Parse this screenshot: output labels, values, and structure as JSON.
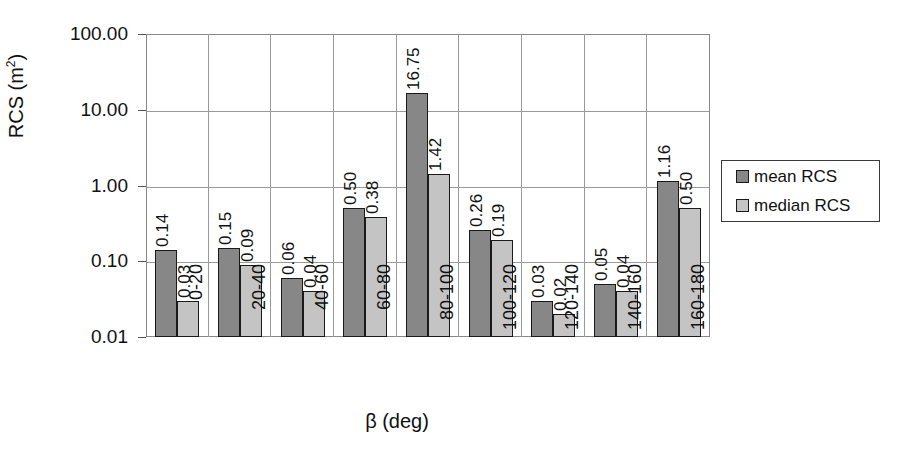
{
  "chart_data": {
    "type": "bar",
    "title": "",
    "xlabel": "β (deg)",
    "ylabel": "RCS (m²)",
    "ylabel_base": "RCS (m",
    "ylabel_sup": "2",
    "ylabel_tail": ")",
    "yscale": "log",
    "ylim": [
      0.01,
      100
    ],
    "grid": true,
    "legend_position": "right",
    "categories": [
      "0-20",
      "20-40",
      "40-60",
      "60-80",
      "80-100",
      "100-120",
      "120-140",
      "140-160",
      "160-180"
    ],
    "ytick_labels": [
      "100.00",
      "10.00",
      "1.00",
      "0.10",
      "0.01"
    ],
    "ytick_values": [
      100,
      10,
      1,
      0.1,
      0.01
    ],
    "series": [
      {
        "name": "mean RCS",
        "color": "#878787",
        "values": [
          0.14,
          0.15,
          0.06,
          0.5,
          16.75,
          0.26,
          0.03,
          0.05,
          1.16
        ],
        "labels": [
          "0.14",
          "0.15",
          "0.06",
          "0.50",
          "16.75",
          "0.26",
          "0.03",
          "0.05",
          "1.16"
        ]
      },
      {
        "name": "median RCS",
        "color": "#c4c4c4",
        "values": [
          0.03,
          0.09,
          0.04,
          0.38,
          1.42,
          0.19,
          0.02,
          0.04,
          0.5
        ],
        "labels": [
          "0.03",
          "0.09",
          "0.04",
          "0.38",
          "1.42",
          "0.19",
          "0.02",
          "0.04",
          "0.50"
        ]
      }
    ]
  },
  "legend": {
    "entries": [
      {
        "label": "mean RCS"
      },
      {
        "label": "median RCS"
      }
    ]
  }
}
